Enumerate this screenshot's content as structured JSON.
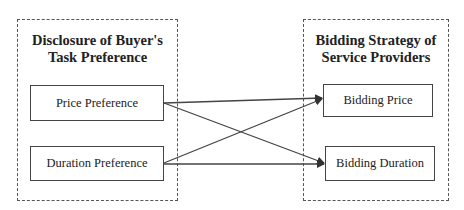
{
  "diagram": {
    "left_group": {
      "title_line1": "Disclosure of Buyer's",
      "title_line2": "Task Preference",
      "nodes": [
        {
          "id": "price_pref",
          "label": "Price Preference"
        },
        {
          "id": "duration_pref",
          "label": "Duration Preference"
        }
      ]
    },
    "right_group": {
      "title_line1": "Bidding Strategy of",
      "title_line2": "Service Providers",
      "nodes": [
        {
          "id": "bid_price",
          "label": "Bidding Price"
        },
        {
          "id": "bid_duration",
          "label": "Bidding Duration"
        }
      ]
    },
    "edges": [
      {
        "from": "Price Preference",
        "to": "Bidding Price"
      },
      {
        "from": "Price Preference",
        "to": "Bidding Duration"
      },
      {
        "from": "Duration Preference",
        "to": "Bidding Price"
      },
      {
        "from": "Duration Preference",
        "to": "Bidding Duration"
      }
    ],
    "colors": {
      "line": "#444444",
      "background": "#ffffff"
    }
  }
}
